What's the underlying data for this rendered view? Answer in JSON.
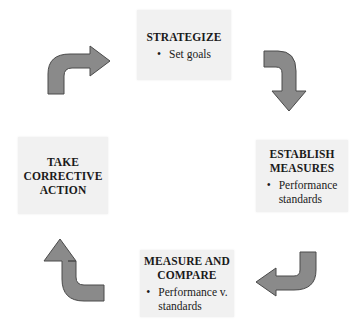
{
  "diagram": {
    "type": "cycle",
    "direction": "clockwise",
    "colors": {
      "box_fill": "#f1f1f1",
      "arrow_fill": "#8a8a8a",
      "arrow_stroke": "#4a4a4a",
      "text": "#1a1a1a"
    },
    "steps": [
      {
        "id": "strategize",
        "title_lines": [
          "STRATEGIZE"
        ],
        "bullets": [
          "Set goals"
        ]
      },
      {
        "id": "establish-measures",
        "title_lines": [
          "ESTABLISH",
          "MEASURES"
        ],
        "bullets": [
          "Performance standards"
        ],
        "bullet_lines": [
          "Performance",
          "standards"
        ]
      },
      {
        "id": "measure-and-compare",
        "title_lines": [
          "MEASURE AND",
          "COMPARE"
        ],
        "bullets": [
          "Performance v. standards"
        ],
        "bullet_lines": [
          "Performance v.",
          "standards"
        ]
      },
      {
        "id": "take-corrective-action",
        "title_lines": [
          "TAKE",
          "CORRECTIVE",
          "ACTION"
        ],
        "bullets": []
      }
    ],
    "arrows": [
      {
        "from": "take-corrective-action",
        "to": "strategize",
        "icon": "curved-arrow-up-right-icon"
      },
      {
        "from": "strategize",
        "to": "establish-measures",
        "icon": "curved-arrow-right-down-icon"
      },
      {
        "from": "establish-measures",
        "to": "measure-and-compare",
        "icon": "curved-arrow-down-left-icon"
      },
      {
        "from": "measure-and-compare",
        "to": "take-corrective-action",
        "icon": "curved-arrow-left-up-icon"
      }
    ],
    "bullet_glyph": "•"
  }
}
